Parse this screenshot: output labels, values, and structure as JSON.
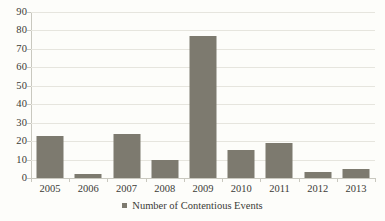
{
  "chart_data": {
    "type": "bar",
    "title": "",
    "subtitle": "",
    "xlabel": "",
    "ylabel": "",
    "categories": [
      "2005",
      "2006",
      "2007",
      "2008",
      "2009",
      "2010",
      "2011",
      "2012",
      "2013"
    ],
    "values": [
      23,
      2,
      24,
      10,
      77,
      15,
      19,
      3,
      5
    ],
    "series": [
      {
        "name": "Number of Contentious Events",
        "values": [
          23,
          2,
          24,
          10,
          77,
          15,
          19,
          3,
          5
        ],
        "color": "#7d7a6f"
      }
    ],
    "ylim": [
      0,
      90
    ],
    "ytick_values": [
      0,
      10,
      20,
      30,
      40,
      50,
      60,
      70,
      80,
      90
    ],
    "ytick_labels": [
      "0",
      "10",
      "20",
      "30",
      "40",
      "50",
      "60",
      "70",
      "80",
      "90"
    ],
    "grid": true,
    "grid_axis": "y",
    "legend": {
      "position": "bottom",
      "entries": [
        {
          "label": "Number of Contentious Events",
          "marker": "square-marker",
          "color": "#7d7a6f"
        }
      ]
    },
    "colors": {
      "bar_fill": "#7d7a6f",
      "gridline": "#e6e5de",
      "axis_line": "#c9c8bf",
      "text": "#3b3b37",
      "background": "#fdfdfa"
    }
  }
}
